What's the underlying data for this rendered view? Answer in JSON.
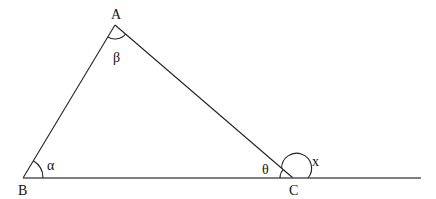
{
  "diagram": {
    "type": "triangle-exterior-angle",
    "vertices": {
      "A": {
        "label": "A",
        "x": 115,
        "y": 25
      },
      "B": {
        "label": "B",
        "x": 23,
        "y": 178
      },
      "C": {
        "label": "C",
        "x": 293,
        "y": 178
      }
    },
    "baseline_end": {
      "x": 421,
      "y": 178
    },
    "angles": {
      "alpha": {
        "label": "α",
        "at": "B"
      },
      "beta": {
        "label": "β",
        "at": "A"
      },
      "theta": {
        "label": "θ",
        "at": "C",
        "kind": "interior"
      },
      "x": {
        "label": "x",
        "at": "C",
        "kind": "exterior"
      }
    },
    "colors": {
      "stroke": "#222222",
      "baseline": "#555555",
      "text": "#111111",
      "background": "#ffffff"
    }
  }
}
